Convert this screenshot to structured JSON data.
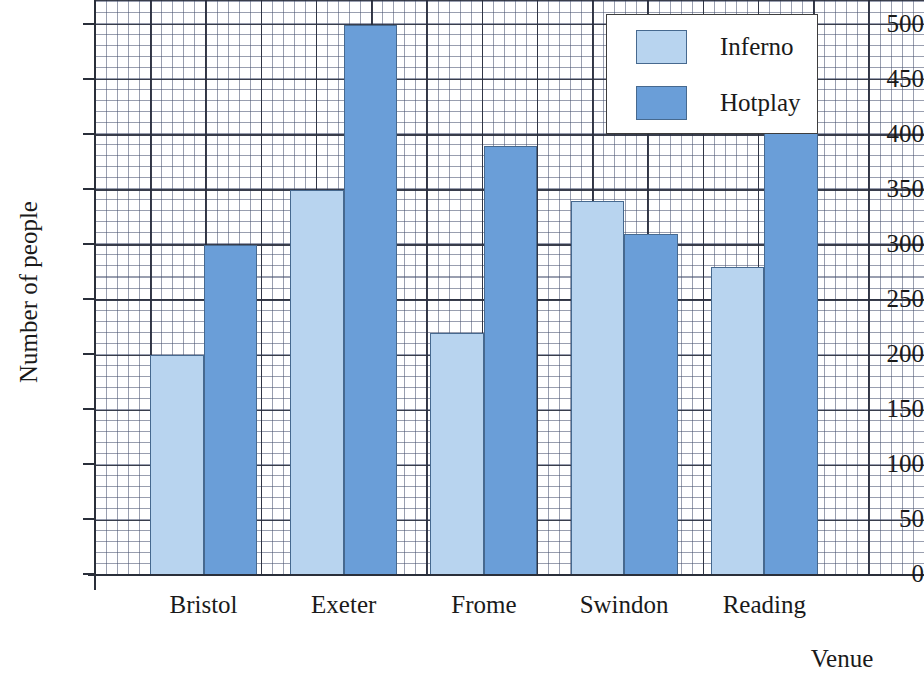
{
  "chart_data": {
    "type": "bar",
    "title": "",
    "xlabel": "Venue",
    "ylabel": "Number of people",
    "categories": [
      "Bristol",
      "Exeter",
      "Frome",
      "Swindon",
      "Reading"
    ],
    "series": [
      {
        "name": "Inferno",
        "color": "#b8d4ef",
        "values": [
          200,
          350,
          220,
          340,
          280
        ]
      },
      {
        "name": "Hotplay",
        "color": "#6a9ed8",
        "values": [
          300,
          500,
          390,
          310,
          420
        ]
      }
    ],
    "ylim": [
      0,
      500
    ],
    "y_ticks": [
      0,
      50,
      100,
      150,
      200,
      250,
      300,
      350,
      400,
      450,
      500
    ],
    "y_tick_labels": [
      "0",
      "50",
      "100",
      "150",
      "200",
      "250",
      "300",
      "350",
      "400",
      "450",
      "500"
    ],
    "y_major_step": 50,
    "y_minor_step": 10,
    "grid": true,
    "grid_style": "graph-paper",
    "legend_position": "top-right",
    "bar_border_color": "#46698f",
    "axis_color": "#2a2f3a"
  },
  "legend": {
    "entries": [
      {
        "label": "Inferno",
        "swatch": "inferno-swatch"
      },
      {
        "label": "Hotplay",
        "swatch": "hotplay-swatch"
      }
    ]
  }
}
